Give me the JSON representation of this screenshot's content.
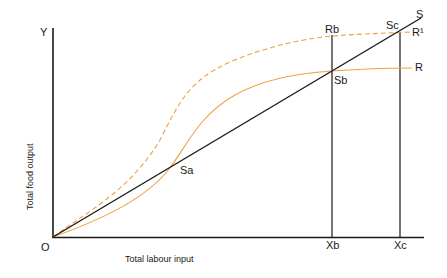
{
  "diagram": {
    "y_axis": {
      "label": "Total food output",
      "end_label": "Y"
    },
    "x_axis": {
      "label": "Total labour input"
    },
    "origin_label": "O",
    "points": {
      "sa": "Sa",
      "sb": "Sb",
      "sc": "Sc",
      "rb": "Rb",
      "xb": "Xb",
      "xc": "Xc"
    },
    "lines": {
      "s_label": "S",
      "r_label": "R",
      "r1_label": "R¹"
    },
    "colors": {
      "axis": "#1a1a1a",
      "curve": "#f0a040",
      "line": "#1a1a1a"
    }
  }
}
